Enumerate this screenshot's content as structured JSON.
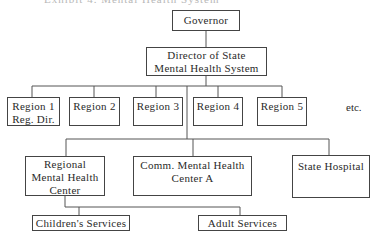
{
  "caption": "Exhibit 4. Mental Health System",
  "chart": {
    "root": {
      "label": [
        "Governor"
      ]
    },
    "director": {
      "label": [
        "Director of State",
        "Mental Health System"
      ]
    },
    "regions": [
      {
        "label": [
          "Region 1",
          "Reg. Dir."
        ]
      },
      {
        "label": [
          "Region 2"
        ]
      },
      {
        "label": [
          "Region 3"
        ]
      },
      {
        "label": [
          "Region 4"
        ]
      },
      {
        "label": [
          "Region 5"
        ]
      }
    ],
    "regions_more": "etc.",
    "facilities": [
      {
        "label": [
          "Regional",
          "Mental Health",
          "Center"
        ]
      },
      {
        "label": [
          "Comm. Mental Health",
          "Center A"
        ]
      },
      {
        "label": [
          "State Hospital"
        ]
      }
    ],
    "services": [
      {
        "label": [
          "Children's Services"
        ]
      },
      {
        "label": [
          "Adult Services"
        ]
      }
    ]
  }
}
